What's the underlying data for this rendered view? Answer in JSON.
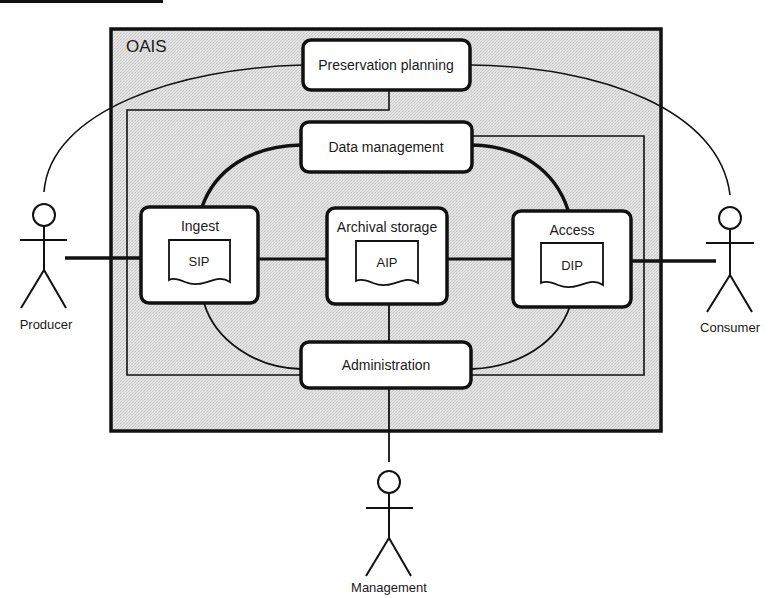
{
  "diagram": {
    "title": "OAIS",
    "colors": {
      "background": "#ffffff",
      "oais_fill": "#dcdcdc",
      "stroke": "#111111",
      "box_fill": "#ffffff"
    },
    "header_bar": {
      "visible": true
    },
    "functional_entities": {
      "preservation_planning": {
        "label": "Preservation planning"
      },
      "data_management": {
        "label": "Data management"
      },
      "ingest": {
        "label": "Ingest",
        "package": "SIP"
      },
      "archival_storage": {
        "label": "Archival storage",
        "package": "AIP"
      },
      "access": {
        "label": "Access",
        "package": "DIP"
      },
      "administration": {
        "label": "Administration"
      }
    },
    "actors": {
      "producer": {
        "label": "Producer"
      },
      "consumer": {
        "label": "Consumer"
      },
      "management": {
        "label": "Management"
      }
    }
  }
}
